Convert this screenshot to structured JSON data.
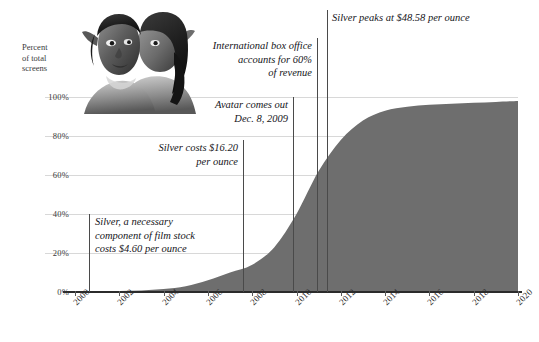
{
  "chart_data": {
    "type": "area",
    "title": "",
    "xlabel": "",
    "ylabel": "Percent of total screens",
    "xlim": [
      2000,
      2020
    ],
    "ylim": [
      0,
      100
    ],
    "grid": true,
    "legend": "none",
    "series": [
      {
        "name": "Percent of total screens that are digital",
        "x": [
          2000,
          2001,
          2002,
          2003,
          2004,
          2005,
          2006,
          2007,
          2008,
          2009,
          2010,
          2011,
          2012,
          2013,
          2014,
          2015,
          2016,
          2017,
          2018,
          2019,
          2020
        ],
        "values": [
          0.2,
          0.3,
          0.5,
          0.8,
          1.5,
          3,
          6,
          10,
          14,
          23,
          40,
          62,
          78,
          88,
          93,
          95,
          96,
          96.5,
          97,
          97.5,
          98
        ]
      }
    ]
  },
  "axes": {
    "y_ticks": [
      "0%",
      "20%",
      "40%",
      "60%",
      "80%",
      "100%"
    ],
    "y_values": [
      0,
      20,
      40,
      60,
      80,
      100
    ],
    "x_ticks": [
      "2000",
      "2002",
      "2004",
      "2006",
      "2008",
      "2010",
      "2012",
      "2014",
      "2016",
      "2018",
      "2020"
    ],
    "x_values": [
      2000,
      2002,
      2004,
      2006,
      2008,
      2010,
      2012,
      2014,
      2016,
      2018,
      2020
    ],
    "y_axis_title": "Percent\nof total\nscreens"
  },
  "annotations": [
    {
      "id": "silver-4-60",
      "text": "Silver, a necessary\ncomponent of film stock\ncosts $4.60 per ounce",
      "year": 2001,
      "align": "left"
    },
    {
      "id": "silver-16-20",
      "text": "Silver costs $16.20\nper ounce",
      "year": 2008,
      "align": "right"
    },
    {
      "id": "avatar-release",
      "text": "Avatar comes out\nDec. 8, 2009",
      "year": 2009.94,
      "align": "right"
    },
    {
      "id": "international-box-office",
      "text": "International box office\naccounts for 60%\nof revenue",
      "year": 2011,
      "align": "right"
    },
    {
      "id": "silver-peak-48-58",
      "text": "Silver peaks at $48.58 per ounce",
      "year": 2011.45,
      "align": "left"
    }
  ],
  "image": {
    "name": "avatar-movie-still",
    "caption": "Avatar film still"
  },
  "colors": {
    "area_fill": "#6e6e6e",
    "gridline": "#d8d8d8",
    "baseline": "#2b2b2b",
    "annotation_line": "#4a4a4a",
    "text": "#15151a",
    "background": "#ffffff"
  }
}
